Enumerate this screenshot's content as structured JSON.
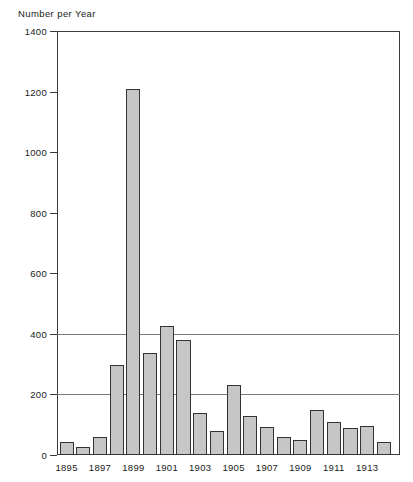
{
  "chart_data": {
    "type": "bar",
    "title": "",
    "ylabel": "Number per Year",
    "xlabel": "",
    "ylim": [
      0,
      1400
    ],
    "ytick_values": [
      0,
      200,
      400,
      600,
      800,
      1000,
      1200,
      1400
    ],
    "ytick_labels": [
      "0",
      "200",
      "400",
      "600",
      "800",
      "1000",
      "1200",
      "1400"
    ],
    "gridlines": [
      200,
      400
    ],
    "grid": true,
    "legend": null,
    "categories": [
      "1895",
      "1896",
      "1897",
      "1898",
      "1899",
      "1900",
      "1901",
      "1902",
      "1903",
      "1904",
      "1905",
      "1906",
      "1907",
      "1908",
      "1909",
      "1910",
      "1911",
      "1912",
      "1913",
      "1914"
    ],
    "xtick_labels": [
      "1895",
      "1897",
      "1899",
      "1901",
      "1903",
      "1905",
      "1907",
      "1909",
      "1911",
      "1913"
    ],
    "values": [
      43,
      27,
      60,
      298,
      1210,
      338,
      425,
      380,
      140,
      78,
      232,
      130,
      93,
      60,
      50,
      148,
      110,
      89,
      96,
      43
    ],
    "bar_fill_color": "#c6c6c6",
    "bar_edge_color": "#333333",
    "axis_color": "#3a3a3a",
    "grid_color": "#7a7a7a",
    "background_color": "#ffffff"
  }
}
